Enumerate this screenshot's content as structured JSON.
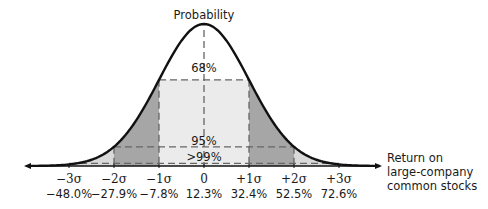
{
  "chart_data": {
    "type": "area",
    "title": "Probability",
    "xlabel": "Return on large-company common stocks",
    "ylabel": "Probability",
    "distribution": "normal",
    "mean": 12.3,
    "std_dev": 20.1,
    "ticks": [
      {
        "sigma": "−3σ",
        "value": "−48.0%"
      },
      {
        "sigma": "−2σ",
        "value": "−27.9%"
      },
      {
        "sigma": "−1σ",
        "value": "−7.8%"
      },
      {
        "sigma": "0",
        "value": "12.3%"
      },
      {
        "sigma": "+1σ",
        "value": "32.4%"
      },
      {
        "sigma": "+2σ",
        "value": "52.5%"
      },
      {
        "sigma": "+3σ",
        "value": "72.6%"
      }
    ],
    "bands": [
      {
        "label": "68%",
        "range_sigma": [
          -1,
          1
        ],
        "fill": "#ebebeb"
      },
      {
        "label": "95%",
        "range_sigma": [
          -2,
          2
        ],
        "fill": "#a6a6a6"
      },
      {
        "label": ">99%",
        "range_sigma": [
          -3,
          3
        ],
        "fill": "#d9d9d9"
      }
    ]
  },
  "labels": {
    "y_axis_title": "Probability",
    "band_68": "68%",
    "band_95": "95%",
    "band_99": ">99%",
    "x_axis_line1": "Return on",
    "x_axis_line2": "large-company",
    "x_axis_line3": "common stocks"
  }
}
